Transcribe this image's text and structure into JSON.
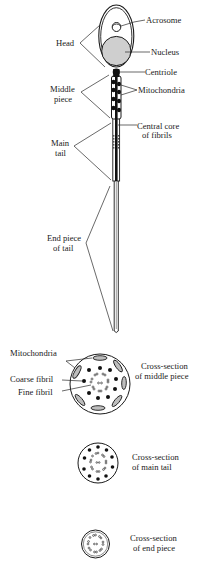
{
  "figure": {
    "type": "labelled anatomical diagram"
  },
  "sperm_labels": {
    "acrosome": "Acrosome",
    "head": "Head",
    "nucleus": "Nucleus",
    "centriole": "Centriole",
    "middle_piece_1": "Middle",
    "middle_piece_2": "piece",
    "mitochondria": "Mitochondria",
    "central_core_1": "Central core",
    "central_core_2": "of fibrils",
    "main_tail_1": "Main",
    "main_tail_2": "tail",
    "end_piece_1": "End piece",
    "end_piece_2": "of tail"
  },
  "cross_sections": {
    "middle": {
      "mitochondria_label": "Mitochondria",
      "coarse_fibril_label": "Coarse fibril",
      "fine_fibril_label": "Fine fibril",
      "caption_1": "Cross-section",
      "caption_2": "of middle piece"
    },
    "main_tail": {
      "caption_1": "Cross-section",
      "caption_2": "of main tail"
    },
    "end_piece": {
      "caption_1": "Cross-section",
      "caption_2": "of end piece"
    }
  },
  "colors": {
    "ink": "#1a1a1a",
    "nucleus_fill": "#cfcfcf",
    "background": "#ffffff"
  }
}
